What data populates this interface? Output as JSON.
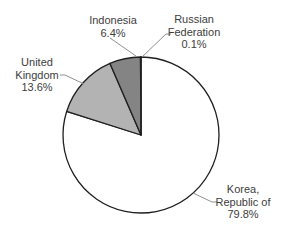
{
  "chart_data": {
    "type": "pie",
    "title": "",
    "start_angle_deg": 0,
    "direction": "clockwise",
    "legend": "none",
    "background": "#ffffff",
    "stroke_color": "#1f1f1f",
    "leader_line_color": "#909090",
    "label_text_color": "#3d3d3d",
    "slices": [
      {
        "name": "Korea, Republic of",
        "value": 79.8,
        "pct_label": "79.8%",
        "label_lines": [
          "Korea,",
          "Republic of"
        ],
        "color": "#ffffff"
      },
      {
        "name": "United Kingdom",
        "value": 13.6,
        "pct_label": "13.6%",
        "label_lines": [
          "United",
          "Kingdom"
        ],
        "color": "#b3b3b3"
      },
      {
        "name": "Indonesia",
        "value": 6.4,
        "pct_label": "6.4%",
        "label_lines": [
          "Indonesia"
        ],
        "color": "#848484"
      },
      {
        "name": "Russian Federation",
        "value": 0.1,
        "pct_label": "0.1%",
        "label_lines": [
          "Russian",
          "Federation"
        ],
        "color": "#ffffff"
      }
    ]
  }
}
